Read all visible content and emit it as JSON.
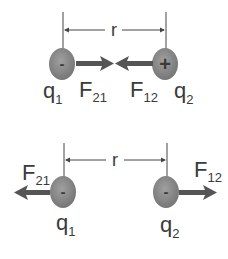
{
  "colors": {
    "charge_fill": "#8a8a8a",
    "charge_edge": "#6f6f6f",
    "arrow": "#555555",
    "line": "#444444",
    "text": "#3a3a3a"
  },
  "panels": [
    {
      "name": "opposite-charges",
      "distance_label": "r",
      "charges": [
        {
          "label": "q",
          "sub": "1",
          "sign": "-"
        },
        {
          "label": "q",
          "sub": "2",
          "sign": "+"
        }
      ],
      "forces": [
        {
          "label": "F",
          "sub": "21",
          "direction": "right"
        },
        {
          "label": "F",
          "sub": "12",
          "direction": "left"
        }
      ]
    },
    {
      "name": "like-charges",
      "distance_label": "r",
      "charges": [
        {
          "label": "q",
          "sub": "1",
          "sign": "-"
        },
        {
          "label": "q",
          "sub": "2",
          "sign": "-"
        }
      ],
      "forces": [
        {
          "label": "F",
          "sub": "21",
          "direction": "left"
        },
        {
          "label": "F",
          "sub": "12",
          "direction": "right"
        }
      ]
    }
  ]
}
